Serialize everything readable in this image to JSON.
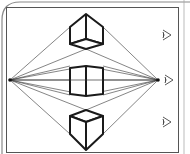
{
  "diagram": {
    "type": "two-point-perspective",
    "colors": {
      "background": "#ffffff",
      "frame": "#555555",
      "frame_outer": "#888888",
      "cube_stroke": "#1a1a1a",
      "guide_lines": "#333333",
      "eye_icon": "#444444"
    },
    "frame": {
      "x": 6,
      "y": 7,
      "width": 172,
      "height": 145
    },
    "horizon_y": 80,
    "vanishing_points": [
      {
        "name": "left-vanishing-point",
        "x": 10,
        "y": 80
      },
      {
        "name": "right-vanishing-point",
        "x": 158,
        "y": 80
      }
    ],
    "cubes": [
      {
        "name": "cube-above-horizon",
        "position": "above eye level"
      },
      {
        "name": "cube-at-horizon",
        "position": "at eye level"
      },
      {
        "name": "cube-below-horizon",
        "position": "below eye level"
      }
    ],
    "eye_icons": [
      {
        "name": "eye-icon-top",
        "y": 35
      },
      {
        "name": "eye-icon-middle",
        "y": 80
      },
      {
        "name": "eye-icon-bottom",
        "y": 122
      }
    ]
  }
}
